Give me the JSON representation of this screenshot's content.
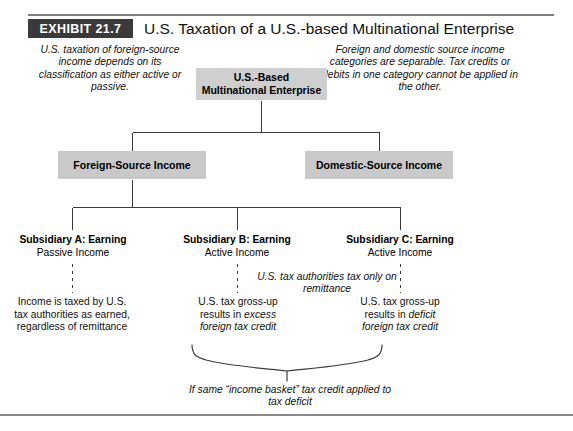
{
  "exhibit": {
    "tag": "EXHIBIT 21.7",
    "title": "U.S. Taxation of a U.S.-based Multinational Enterprise"
  },
  "notes": {
    "left": "U.S. taxation of foreign-source income depends on its classification as either active or passive.",
    "right": "Foreign and domestic source income categories are separable. Tax credits or debits in one category cannot be applied in the other.",
    "middle": "U.S. tax authorities tax only on remittance",
    "brace": "If same “income basket” tax credit applied to tax deficit"
  },
  "nodes": {
    "root": "U.S.-Based Multinational Enterprise",
    "root_line1": "U.S.-Based",
    "root_line2": "Multinational Enterprise",
    "foreign_source": "Foreign-Source Income",
    "domestic_source": "Domestic-Source Income"
  },
  "subsidiaries": [
    {
      "title": "Subsidiary A: Earning",
      "subtitle": "Passive Income"
    },
    {
      "title": "Subsidiary B: Earning",
      "subtitle": "Active Income"
    },
    {
      "title": "Subsidiary C: Earning",
      "subtitle": "Active Income"
    }
  ],
  "leaves": {
    "a": "Income is taxed by U.S. tax authorities as earned, regardless of remittance",
    "b_plain1": "U.S. tax gross-up",
    "b_plain2": "results in ",
    "b_italic1": "excess",
    "b_italic2": "foreign tax credit",
    "c_plain1": "U.S. tax gross-up",
    "c_plain2": "results in ",
    "c_italic1": "deficit",
    "c_italic2": "foreign tax credit"
  },
  "colors": {
    "box_fill": "#c9c9c9",
    "tag_fill": "#3a3a3a",
    "rule": "#7f7f7f",
    "line": "#3c3c3c"
  }
}
